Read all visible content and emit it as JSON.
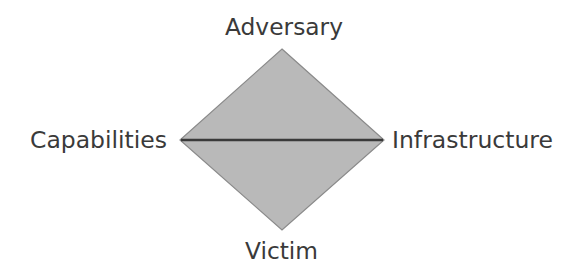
{
  "diagram": {
    "vertices": {
      "top": "Adversary",
      "left": "Capabilities",
      "right": "Infrastructure",
      "bottom": "Victim"
    },
    "colors": {
      "fill": "#b9b9b9",
      "edge": "#8a8a8a",
      "center_line": "#3a3a3a",
      "text": "#3a3a3a"
    }
  }
}
